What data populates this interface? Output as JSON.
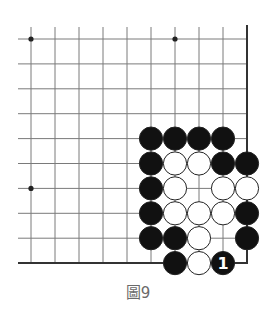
{
  "diagram": {
    "caption": "圖9",
    "grid": {
      "cols": 10,
      "rows": 10,
      "x0": 31,
      "y0": 39,
      "dx": 24,
      "dy": 24.9,
      "line_left": 18,
      "line_top": 27,
      "right_edge_col": 9,
      "bottom_edge_row": 9
    },
    "star_points": [
      [
        0,
        0
      ],
      [
        6,
        0
      ],
      [
        0,
        6
      ]
    ],
    "stones": [
      {
        "col": 5,
        "row": 4,
        "color": "black"
      },
      {
        "col": 6,
        "row": 4,
        "color": "black"
      },
      {
        "col": 7,
        "row": 4,
        "color": "black"
      },
      {
        "col": 8,
        "row": 4,
        "color": "black"
      },
      {
        "col": 5,
        "row": 5,
        "color": "black"
      },
      {
        "col": 6,
        "row": 5,
        "color": "white"
      },
      {
        "col": 7,
        "row": 5,
        "color": "white"
      },
      {
        "col": 8,
        "row": 5,
        "color": "black"
      },
      {
        "col": 9,
        "row": 5,
        "color": "black"
      },
      {
        "col": 5,
        "row": 6,
        "color": "black"
      },
      {
        "col": 6,
        "row": 6,
        "color": "white"
      },
      {
        "col": 8,
        "row": 6,
        "color": "white"
      },
      {
        "col": 9,
        "row": 6,
        "color": "white"
      },
      {
        "col": 5,
        "row": 7,
        "color": "black"
      },
      {
        "col": 6,
        "row": 7,
        "color": "white"
      },
      {
        "col": 7,
        "row": 7,
        "color": "white"
      },
      {
        "col": 8,
        "row": 7,
        "color": "white"
      },
      {
        "col": 9,
        "row": 7,
        "color": "black"
      },
      {
        "col": 5,
        "row": 8,
        "color": "black"
      },
      {
        "col": 6,
        "row": 8,
        "color": "black"
      },
      {
        "col": 7,
        "row": 8,
        "color": "white"
      },
      {
        "col": 9,
        "row": 8,
        "color": "black"
      },
      {
        "col": 6,
        "row": 9,
        "color": "black"
      },
      {
        "col": 7,
        "row": 9,
        "color": "white"
      },
      {
        "col": 8,
        "row": 9,
        "color": "black",
        "label": "1"
      }
    ],
    "colors": {
      "line": "#7a7a7a",
      "edge": "#333333",
      "black_stone": "#111111",
      "white_stone": "#ffffff",
      "stone_outline": "#222222",
      "label_on_black": "#ffffff"
    }
  }
}
